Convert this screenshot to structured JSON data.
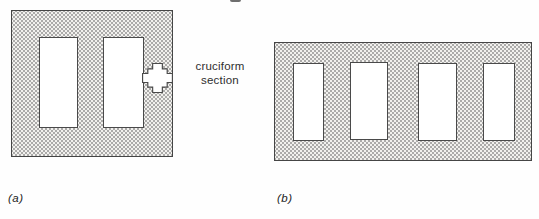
{
  "figure": {
    "type": "textbook-diagram",
    "panels": [
      {
        "id": "a",
        "label": "(a)",
        "plate_shape": "square",
        "openings_count": 2,
        "annotation": {
          "line1": "cruciform",
          "line2": "section"
        }
      },
      {
        "id": "b",
        "label": "(b)",
        "plate_shape": "wide-rectangle",
        "openings_count": 4
      }
    ],
    "colors": {
      "background": "#fefefe",
      "plate_fill_base": "#f2f1ee",
      "stipple_dot": "#6e6e6e",
      "outline": "#454545",
      "text": "#2e2e2e"
    }
  }
}
